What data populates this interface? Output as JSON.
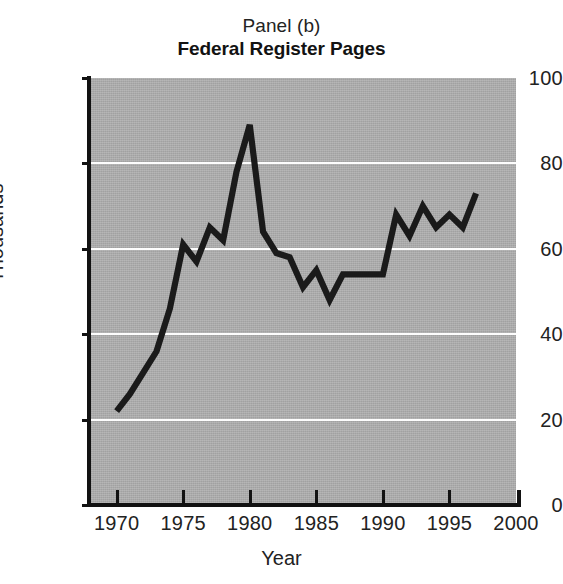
{
  "titles": {
    "panel": "Panel (b)",
    "main": "Federal Register Pages"
  },
  "axes": {
    "xlabel": "Year",
    "ylabel": "Thousands",
    "x_ticks": [
      "1970",
      "1975",
      "1980",
      "1985",
      "1990",
      "1995",
      "2000"
    ],
    "y_ticks": [
      "100",
      "80",
      "60",
      "40",
      "20",
      "0"
    ]
  },
  "colors": {
    "plot_background": "#ababab",
    "gridline": "#fdfdfd",
    "series_line": "#1a1a1a",
    "axis": "#121212",
    "page_background": "#ffffff"
  },
  "chart_data": {
    "type": "line",
    "title": "Federal Register Pages",
    "subtitle": "Panel (b)",
    "xlabel": "Year",
    "ylabel": "Thousands",
    "xlim": [
      1968,
      2000
    ],
    "ylim": [
      0,
      100
    ],
    "xtick_values": [
      1970,
      1975,
      1980,
      1985,
      1990,
      1995,
      2000
    ],
    "ytick_values": [
      0,
      20,
      40,
      60,
      80,
      100
    ],
    "grid": "horizontal",
    "legend": "none",
    "units": "thousands of pages",
    "series": [
      {
        "name": "Federal Register Pages",
        "x": [
          1970,
          1971,
          1972,
          1973,
          1974,
          1975,
          1976,
          1977,
          1978,
          1979,
          1980,
          1981,
          1982,
          1983,
          1984,
          1985,
          1986,
          1987,
          1988,
          1989,
          1990,
          1991,
          1992,
          1993,
          1994,
          1995,
          1996,
          1997
        ],
        "values": [
          22,
          26,
          31,
          36,
          46,
          61,
          57,
          65,
          62,
          78,
          89,
          64,
          59,
          58,
          51,
          55,
          48,
          54,
          54,
          54,
          54,
          68,
          63,
          70,
          65,
          68,
          65,
          73
        ]
      }
    ]
  }
}
